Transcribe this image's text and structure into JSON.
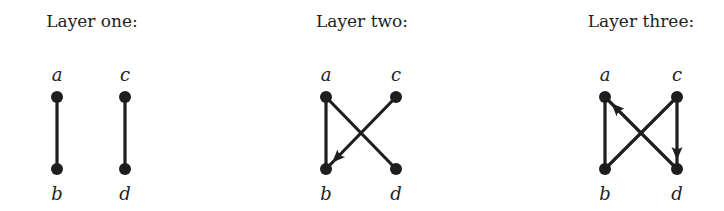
{
  "colors": {
    "ink": "#1e1e1e",
    "background": "#ffffff"
  },
  "layers": [
    {
      "title": "Layer one:",
      "title_x": 92,
      "nodes": {
        "a": [
          57,
          97
        ],
        "c": [
          125,
          97
        ],
        "b": [
          57,
          169
        ],
        "d": [
          125,
          169
        ]
      },
      "labels": {
        "a": "a",
        "b": "b",
        "c": "c",
        "d": "d"
      },
      "edges": [
        {
          "from": "a",
          "to": "b",
          "directed": false
        },
        {
          "from": "c",
          "to": "d",
          "directed": false
        }
      ]
    },
    {
      "title": "Layer two:",
      "title_x": 362,
      "nodes": {
        "a": [
          326,
          97
        ],
        "c": [
          396,
          97
        ],
        "b": [
          326,
          169
        ],
        "d": [
          396,
          169
        ]
      },
      "labels": {
        "a": "a",
        "b": "b",
        "c": "c",
        "d": "d"
      },
      "edges": [
        {
          "from": "a",
          "to": "b",
          "directed": false
        },
        {
          "from": "a",
          "to": "d",
          "directed": false
        },
        {
          "from": "c",
          "to": "b",
          "directed": true
        }
      ]
    },
    {
      "title": "Layer three:",
      "title_x": 641,
      "nodes": {
        "a": [
          605,
          97
        ],
        "c": [
          677,
          97
        ],
        "b": [
          605,
          169
        ],
        "d": [
          677,
          169
        ]
      },
      "labels": {
        "a": "a",
        "b": "b",
        "c": "c",
        "d": "d"
      },
      "edges": [
        {
          "from": "a",
          "to": "b",
          "directed": false
        },
        {
          "from": "b",
          "to": "c",
          "directed": false
        },
        {
          "from": "d",
          "to": "a",
          "directed": true
        },
        {
          "from": "c",
          "to": "d",
          "directed": true
        }
      ]
    }
  ]
}
